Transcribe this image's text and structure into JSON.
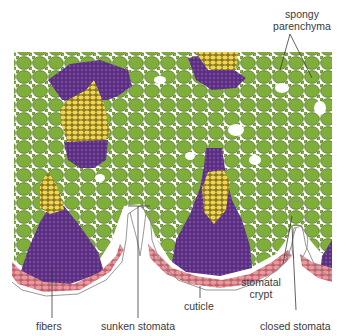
{
  "diagram": {
    "type": "leaf cross-section (xerophyte)",
    "colors": {
      "mesophyll": "#7fae3a",
      "mesophyll_outline": "#3f5a1c",
      "xylem": "#f2d455",
      "fibers": "#5a2f80",
      "epidermis": "#e59aa0",
      "cuticle_line": "#888888",
      "background": "#ffffff"
    },
    "labels": {
      "spongy": "spongy",
      "parenchyma": "parenchyma",
      "fibers": "fibers",
      "sunken_stomata": "sunken stomata",
      "cuticle": "cuticle",
      "stomatal": "stomatal",
      "crypt": "crypt",
      "closed_stomata": "closed stomata"
    }
  }
}
